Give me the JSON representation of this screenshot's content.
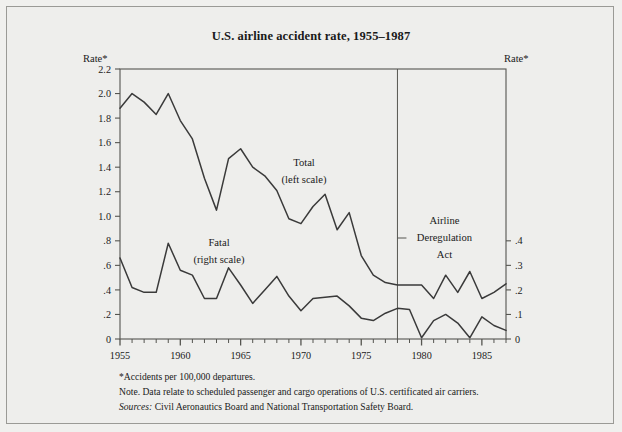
{
  "figure": {
    "title": "U.S. airline accident rate, 1955–1987",
    "left_axis_label": "Rate*",
    "right_axis_label": "Rate*",
    "footnote_1": "*Accidents per 100,000 departures.",
    "footnote_2": "Note. Data relate to scheduled passenger and cargo operations of U.S. certificated air carriers.",
    "sources_label": "Sources:",
    "sources_text": "Civil Aeronautics Board and National Transportation Safety Board.",
    "background_color": "#eeeeec",
    "line_color": "#3a3a3a",
    "axis_color": "#555550"
  },
  "chart_data": {
    "type": "line",
    "title": "U.S. airline accident rate, 1955–1987",
    "xlabel": "",
    "ylabel": "Rate*",
    "y2label": "Rate*",
    "xlim": [
      1955,
      1987
    ],
    "ylim": [
      0,
      2.2
    ],
    "y2lim": [
      0,
      1.1
    ],
    "grid": false,
    "legend": "inline-annotations",
    "x": [
      1955,
      1956,
      1957,
      1958,
      1959,
      1960,
      1961,
      1962,
      1963,
      1964,
      1965,
      1966,
      1967,
      1968,
      1969,
      1970,
      1971,
      1972,
      1973,
      1974,
      1975,
      1976,
      1977,
      1978,
      1979,
      1980,
      1981,
      1982,
      1983,
      1984,
      1985,
      1986,
      1987
    ],
    "xticks": [
      1955,
      1960,
      1965,
      1970,
      1975,
      1980,
      1985
    ],
    "xticklabels": [
      "1955",
      "1960",
      "1965",
      "1970",
      "1975",
      "1980",
      "1985"
    ],
    "yticks": [
      0,
      0.2,
      0.4,
      0.6,
      0.8,
      1.0,
      1.2,
      1.4,
      1.6,
      1.8,
      2.0,
      2.2
    ],
    "yticklabels": [
      "0",
      ".2",
      ".4",
      ".6",
      ".8",
      "1.0",
      "1.2",
      "1.4",
      "1.6",
      "1.8",
      "2.0",
      "2.2"
    ],
    "y2ticks": [
      0,
      0.1,
      0.2,
      0.3,
      0.4
    ],
    "y2ticklabels": [
      "0",
      ".1",
      ".2",
      ".3",
      ".4"
    ],
    "series": [
      {
        "name": "Total",
        "label": "Total",
        "sublabel": "(left scale)",
        "scale": "left",
        "values": [
          1.88,
          2.0,
          1.93,
          1.83,
          2.0,
          1.78,
          1.63,
          1.31,
          1.05,
          1.47,
          1.55,
          1.4,
          1.33,
          1.21,
          0.98,
          0.94,
          1.08,
          1.18,
          0.89,
          1.03,
          0.68,
          0.52,
          0.46,
          0.44,
          0.44,
          0.44,
          0.33,
          0.52,
          0.38,
          0.55,
          0.33,
          0.38,
          0.45
        ]
      },
      {
        "name": "Fatal",
        "label": "Fatal",
        "sublabel": "(right scale)",
        "scale": "right",
        "values": [
          0.33,
          0.21,
          0.19,
          0.19,
          0.39,
          0.28,
          0.26,
          0.165,
          0.165,
          0.29,
          0.22,
          0.145,
          0.2,
          0.255,
          0.175,
          0.115,
          0.165,
          0.17,
          0.175,
          0.135,
          0.085,
          0.075,
          0.105,
          0.125,
          0.12,
          0.005,
          0.075,
          0.1,
          0.065,
          0.005,
          0.09,
          0.055,
          0.035
        ]
      }
    ],
    "annotations": [
      {
        "name": "deregulation-line",
        "type": "vline",
        "x": 1978,
        "label_line_1": "Airline",
        "label_line_2": "Deregulation",
        "label_line_3": "Act"
      }
    ]
  }
}
